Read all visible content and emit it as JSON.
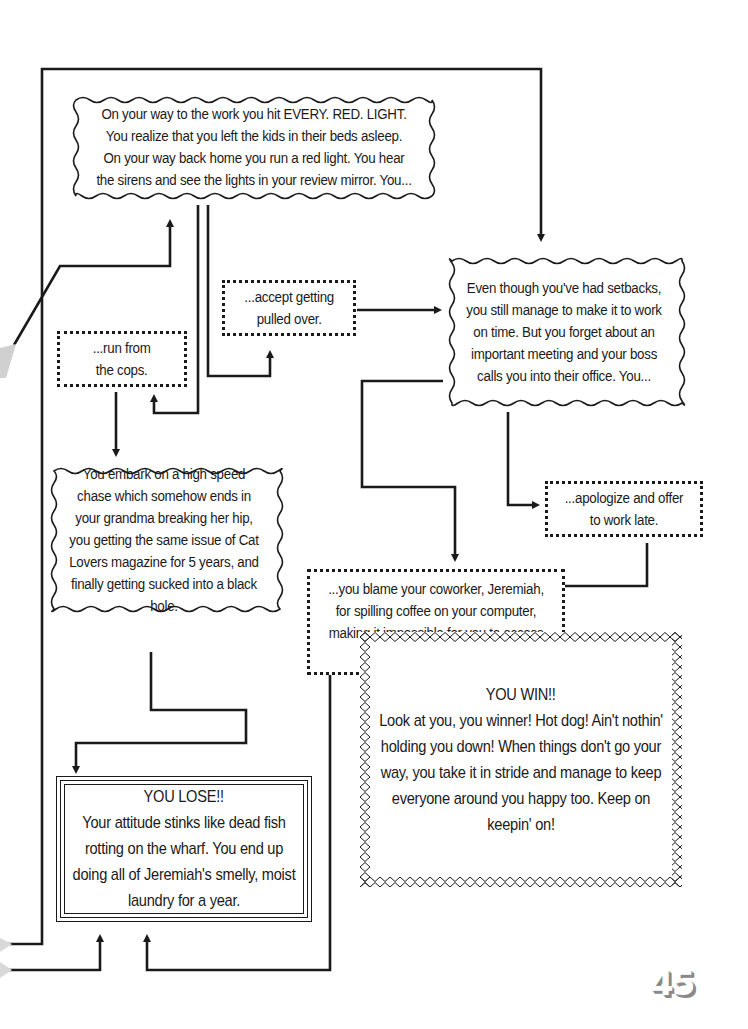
{
  "diagram": {
    "type": "choose-your-path flowchart",
    "nodes": {
      "start": {
        "text": "On your way to the work you hit EVERY. RED. LIGHT.  You realize that you left the kids in their beds asleep. On your way back home you run a red light. You hear the sirens and see the lights in your review mirror. You..."
      },
      "run_from_cops": {
        "text": "...run from\nthe cops."
      },
      "accept_pulled_over": {
        "text": "...accept getting\npulled over."
      },
      "made_it_to_work": {
        "text": "Even though you've had setbacks, you still manage to make it to work on time. But you forget about an important meeting and your boss calls you into their office. You..."
      },
      "high_speed_chase": {
        "text": "You embark on a high speed chase which somehow ends in your grandma breaking her hip, you getting the same issue of Cat Lovers magazine for 5 years, and finally getting sucked into a black hole."
      },
      "apologize": {
        "text": "...apologize and offer\nto work late."
      },
      "blame_coworker": {
        "text": "...you blame your coworker, Jeremiah, for spilling coffee on your computer, making it impossible for you to access your calendar."
      },
      "you_lose": {
        "title": "YOU LOSE!!",
        "text": "Your attitude stinks like dead fish rotting on the wharf. You end up doing all of Jeremiah's smelly, moist laundry for a year."
      },
      "you_win": {
        "title": "YOU WIN!!",
        "text": "Look at you, you winner! Hot dog! Ain't nothin' holding you down! When things don't go your way, you take it in stride and manage to keep everyone around you happy too. Keep on keepin' on!"
      }
    },
    "edges": [
      {
        "from": "start",
        "to": "run_from_cops"
      },
      {
        "from": "start",
        "to": "accept_pulled_over"
      },
      {
        "from": "start",
        "to": "made_it_to_work"
      },
      {
        "from": "accept_pulled_over",
        "to": "made_it_to_work"
      },
      {
        "from": "run_from_cops",
        "to": "high_speed_chase"
      },
      {
        "from": "made_it_to_work",
        "to": "apologize"
      },
      {
        "from": "made_it_to_work",
        "to": "blame_coworker"
      },
      {
        "from": "high_speed_chase",
        "to": "you_lose"
      },
      {
        "from": "blame_coworker",
        "to": "you_lose"
      },
      {
        "from": "apologize",
        "to": "you_win"
      }
    ]
  },
  "page": {
    "number": "45"
  },
  "colors": {
    "ink": "#1a1a1a",
    "background": "#ffffff",
    "page_number_shadow": "#8a8a8a",
    "margin_mark": "#d0d0d0"
  }
}
